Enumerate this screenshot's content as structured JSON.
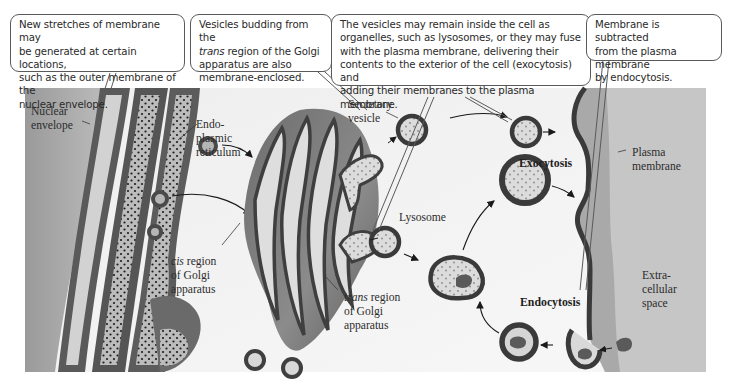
{
  "figure": {
    "colors": {
      "background": "#ffffff",
      "cytoplasm": "#f2f2f2",
      "extracellular": "#c9c9c9",
      "membrane_dark": "#4a4a4a",
      "membrane_mid": "#7a7a7a",
      "lumen": "#d6d6d6",
      "callout_border": "#5a5a5a"
    }
  },
  "callouts": [
    {
      "id": "new-membrane",
      "lines": [
        "New stretches of membrane may",
        "be generated at certain locations,",
        "such as the outer membrane of the",
        "nuclear envelope."
      ]
    },
    {
      "id": "vesicle-budding",
      "lines_pre": "Vesicles budding from the",
      "italic_word": "trans",
      "line2_rest": " region of the Golgi",
      "lines_post": [
        "apparatus are also",
        "membrane-enclosed."
      ]
    },
    {
      "id": "vesicle-fate",
      "lines": [
        "The vesicles may remain inside the cell as",
        "organelles, such as lysosomes, or they may fuse",
        "with the plasma membrane, delivering their",
        "contents to the exterior of the cell (exocytosis) and",
        "adding their membranes to the plasma membrane."
      ]
    },
    {
      "id": "membrane-subtracted",
      "lines": [
        "Membrane is subtracted",
        "from the plasma membrane",
        "by endocytosis."
      ]
    }
  ],
  "labels": {
    "nuclear_envelope": [
      "Nuclear",
      "envelope"
    ],
    "er": [
      "Endo-",
      "plasmic",
      "reticulum"
    ],
    "secretory_vesicle": [
      "Secretory",
      "vesicle"
    ],
    "lysosome": "Lysosome",
    "cis_region": {
      "italic": "cis",
      "rest": " region",
      "lines": [
        "of Golgi",
        "apparatus"
      ]
    },
    "trans_region": {
      "italic": "trans",
      "rest": " region",
      "lines": [
        "of Golgi",
        "apparatus"
      ]
    },
    "exocytosis": "Exocytosis",
    "endocytosis": "Endocytosis",
    "plasma_membrane": [
      "Plasma",
      "membrane"
    ],
    "extracellular_space": [
      "Extra-",
      "cellular",
      "space"
    ]
  }
}
